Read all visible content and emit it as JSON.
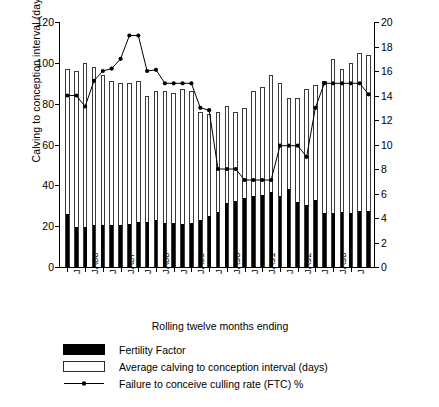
{
  "chart_data": {
    "type": "bar",
    "title": "",
    "xlabel": "Rolling twelve months ending",
    "ylabel": "Calving to conception interval (days)",
    "ylabel_right": "Fertility Factor and FTC culling rate",
    "ylim": [
      0,
      120
    ],
    "ylim_right": [
      0,
      20
    ],
    "yticks": [
      0,
      20,
      40,
      60,
      80,
      100,
      120
    ],
    "yticks_right": [
      0,
      2,
      4,
      6,
      8,
      10,
      12,
      14,
      16,
      18,
      20
    ],
    "grid": false,
    "legend_position": "below-axes",
    "x_tick_labels": [
      "J",
      "JA86",
      "J",
      "JA87",
      "J",
      "JA88",
      "J",
      "JA89",
      "J",
      "JA90",
      "J",
      "JA91",
      "J",
      "JA92",
      "J",
      "JA93",
      "J"
    ],
    "x_tick_indices": [
      0,
      2,
      4,
      6,
      8,
      10,
      12,
      14,
      16,
      18,
      20,
      22,
      24,
      26,
      28,
      30,
      32
    ],
    "n_points": 34,
    "series": [
      {
        "name": "Average calving to conception interval (days)",
        "axis": "left",
        "style": "open-bar",
        "color": "#ffffff",
        "edge": "#3a3a3a",
        "values": [
          97,
          96,
          100,
          98,
          94,
          91,
          90,
          90,
          91,
          84,
          86,
          86,
          85,
          87,
          86,
          76,
          75,
          76,
          79,
          76,
          78,
          86,
          88,
          94,
          90,
          83,
          83,
          87,
          89,
          91,
          102,
          97,
          100,
          105,
          104
        ]
      },
      {
        "name": "Fertility Factor",
        "axis": "right",
        "style": "solid-bar",
        "color": "#000000",
        "values": [
          4.3,
          3.3,
          3.3,
          3.4,
          3.4,
          3.4,
          3.4,
          3.5,
          3.7,
          3.7,
          3.8,
          3.6,
          3.6,
          3.5,
          3.6,
          3.8,
          4.2,
          4.5,
          5.2,
          5.4,
          5.6,
          5.8,
          5.9,
          6.1,
          5.8,
          6.4,
          5.3,
          5.1,
          5.5,
          4.4,
          4.4,
          4.5,
          4.4,
          4.6,
          4.6
        ]
      },
      {
        "name": "Failure to conceive culling rate (FTC) %",
        "axis": "right",
        "style": "line-marker",
        "color": "#000000",
        "values": [
          14.0,
          14.0,
          13.1,
          15.2,
          16.0,
          16.2,
          17.0,
          18.9,
          18.9,
          16.0,
          16.1,
          15.0,
          15.0,
          15.0,
          15.0,
          13.0,
          12.8,
          8.0,
          8.0,
          8.0,
          7.1,
          7.1,
          7.1,
          7.1,
          9.9,
          9.9,
          9.9,
          9.0,
          13.0,
          15.0,
          15.0,
          15.0,
          15.0,
          15.0,
          14.1
        ]
      }
    ]
  },
  "legend": {
    "items": [
      {
        "key": "solid-swatch",
        "label": "Fertility Factor"
      },
      {
        "key": "open-swatch",
        "label": "Average calving to conception interval (days)"
      },
      {
        "key": "line-swatch",
        "label": "Failure to conceive culling rate (FTC) %"
      }
    ]
  }
}
